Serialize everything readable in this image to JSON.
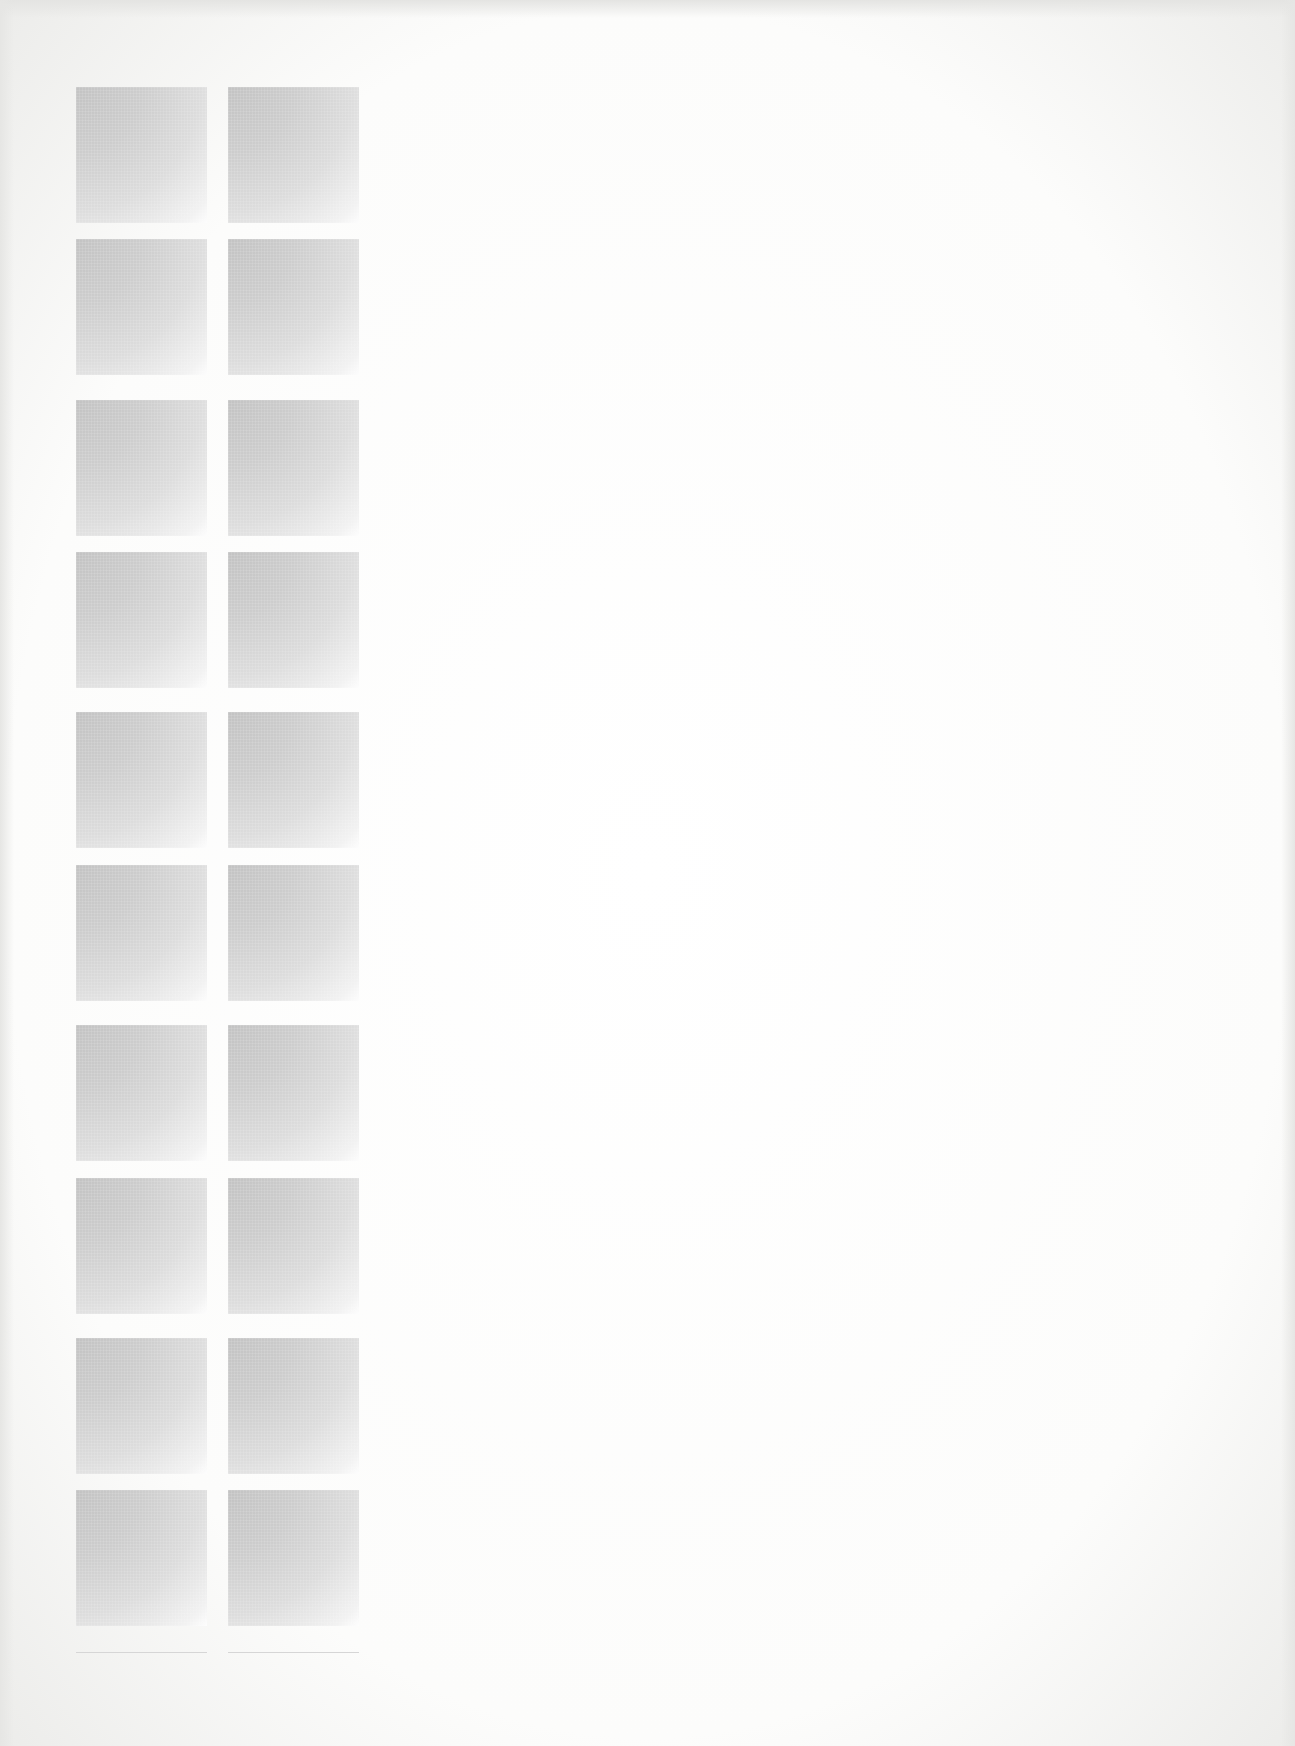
{
  "page": {
    "background_color": "#fcfcfb",
    "tile_color_dark": "#c3c3c3",
    "tile_color_light": "#fdfdfd"
  },
  "grid": {
    "columns": 2,
    "rows": 10,
    "column_x": [
      76,
      228
    ],
    "row_y": [
      87,
      239,
      400,
      552,
      712,
      865,
      1025,
      1178,
      1338,
      1490
    ],
    "tile_width": 131,
    "tile_height": 136,
    "tile_icon": "gray-gradient-square"
  },
  "bottom_rules": [
    {
      "x": 76,
      "y": 1652,
      "width": 131
    },
    {
      "x": 228,
      "y": 1652,
      "width": 131
    }
  ]
}
